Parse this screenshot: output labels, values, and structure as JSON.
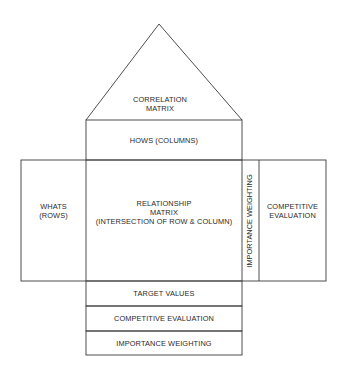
{
  "diagram": {
    "type": "house-of-quality",
    "roof": {
      "line1": "CORRELATION",
      "line2": "MATRIX"
    },
    "hows": "HOWS (COLUMNS)",
    "whats": {
      "line1": "WHATS",
      "line2": "(ROWS)"
    },
    "relationship": {
      "line1": "RELATIONSHIP",
      "line2": "MATRIX",
      "line3": "(INTERSECTION OF ROW & COLUMN)"
    },
    "importance_vertical": "IMPORTANCE WEIGHTING",
    "competitive_right": {
      "line1": "COMPETITIVE",
      "line2": "EVALUATION"
    },
    "bottom": {
      "target": "TARGET VALUES",
      "competitive": "COMPETITIVE EVALUATION",
      "importance": "IMPORTANCE WEIGHTING"
    },
    "colors": {
      "line": "#3a3a3a",
      "background": "#ffffff"
    }
  }
}
